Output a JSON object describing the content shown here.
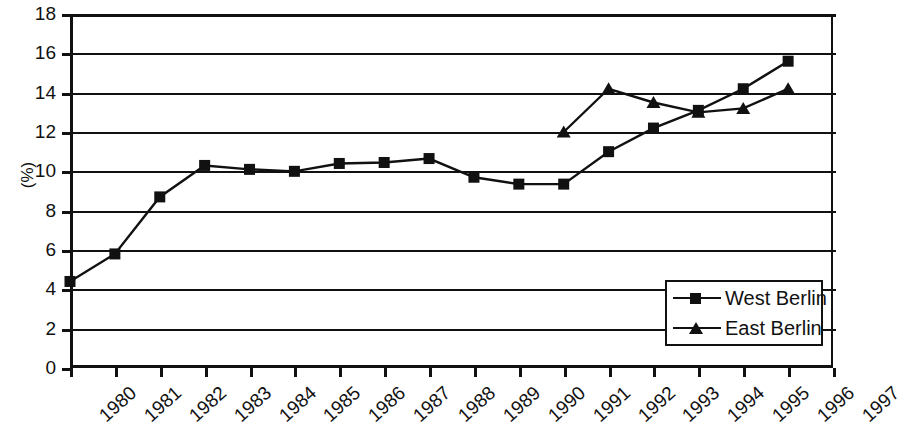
{
  "chart_data": {
    "type": "line",
    "title": "",
    "xlabel": "",
    "ylabel": "(%)",
    "x": [
      1980,
      1981,
      1982,
      1983,
      1984,
      1985,
      1986,
      1987,
      1988,
      1989,
      1990,
      1991,
      1992,
      1993,
      1994,
      1995,
      1996,
      1997
    ],
    "categories": [
      "1980",
      "1981",
      "1982",
      "1983",
      "1984",
      "1985",
      "1986",
      "1987",
      "1988",
      "1989",
      "1990",
      "1991",
      "1992",
      "1993",
      "1994",
      "1995",
      "1996",
      "1997"
    ],
    "xlim": [
      1980,
      1997
    ],
    "ylim": [
      0,
      18
    ],
    "yticks": [
      0,
      2,
      4,
      6,
      8,
      10,
      12,
      14,
      16,
      18
    ],
    "ytick_labels": [
      "0",
      "2",
      "4",
      "6",
      "8",
      "10",
      "12",
      "14",
      "16",
      "18"
    ],
    "grid": "horizontal",
    "legend_position": "bottom-right",
    "series": [
      {
        "name": "West Berlin",
        "marker": "square",
        "color": "#111111",
        "x": [
          1980,
          1981,
          1982,
          1983,
          1984,
          1985,
          1986,
          1987,
          1988,
          1989,
          1990,
          1991,
          1992,
          1993,
          1994,
          1995,
          1996
        ],
        "values": [
          4.4,
          5.8,
          8.7,
          10.3,
          10.1,
          10.0,
          10.4,
          10.45,
          10.65,
          9.7,
          9.35,
          9.35,
          11.0,
          12.2,
          13.1,
          14.2,
          15.6
        ]
      },
      {
        "name": "East Berlin",
        "marker": "triangle",
        "color": "#111111",
        "x": [
          1991,
          1992,
          1993,
          1994,
          1995,
          1996
        ],
        "values": [
          12.0,
          14.2,
          13.5,
          13.0,
          13.2,
          14.2
        ]
      }
    ]
  },
  "legend": {
    "items": [
      {
        "label": "West Berlin",
        "marker": "square"
      },
      {
        "label": "East Berlin",
        "marker": "triangle"
      }
    ]
  }
}
